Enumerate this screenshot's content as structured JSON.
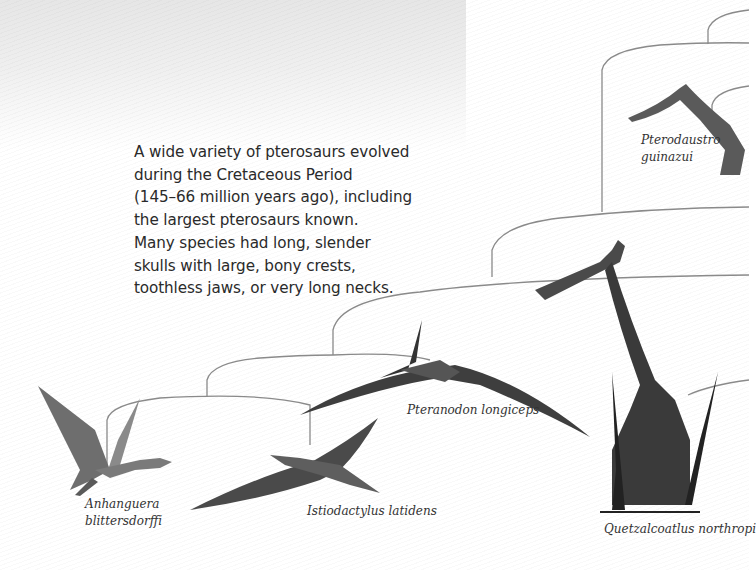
{
  "intro": {
    "lines": [
      "A wide variety of pterosaurs evolved",
      "during the Cretaceous Period",
      "(145–66 million years ago), including",
      "the largest pterosaurs known.",
      "Many species had long, slender",
      "skulls with large, bony crests,",
      "toothless jaws, or very long necks."
    ]
  },
  "species": {
    "anhanguera": {
      "line1": "Anhanguera",
      "line2": "blittersdorffi"
    },
    "istiodactylus": {
      "name": "Istiodactylus latidens"
    },
    "pteranodon": {
      "name": "Pteranodon longiceps"
    },
    "quetzalcoatlus": {
      "name": "Quetzalcoatlus northropi"
    },
    "pterodaustro": {
      "line1": "Pterodaustro",
      "line2": "guinazui"
    }
  },
  "colors": {
    "text": "#2a2a2a",
    "branch_line": "#8a8a8a",
    "creature_dark": "#3a3a3a",
    "creature_mid": "#6e6e6e",
    "background_gray": "#e6e6e6"
  }
}
